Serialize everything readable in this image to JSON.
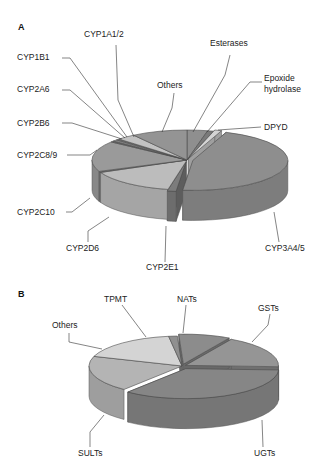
{
  "chart_data": [
    {
      "panel": "A",
      "type": "pie",
      "style": "3d",
      "title": "",
      "slices": [
        {
          "label": "Esterases",
          "value": 3.5,
          "color": "#8f8f8f"
        },
        {
          "label": "Epoxide hydrolase",
          "value": 1.0,
          "color": "#7a7a7a"
        },
        {
          "label": "DPYD",
          "value": 1.2,
          "color": "#d4d4d4"
        },
        {
          "label": "CYP3A4/5",
          "value": 46.0,
          "color": "#8e8e8e"
        },
        {
          "label": "CYP2E1",
          "value": 1.5,
          "color": "#7c7c7c"
        },
        {
          "label": "CYP2D6",
          "value": 15.0,
          "color": "#bcbcbc"
        },
        {
          "label": "CYP2C10",
          "value": 0.6,
          "color": "#6e6e6e"
        },
        {
          "label": "CYP2C8/9",
          "value": 16.5,
          "color": "#9a9a9a"
        },
        {
          "label": "CYP2B6",
          "value": 0.6,
          "color": "#6a6a6a"
        },
        {
          "label": "CYP2A6",
          "value": 0.8,
          "color": "#8a8a8a"
        },
        {
          "label": "CYP1B1",
          "value": 0.6,
          "color": "#777777"
        },
        {
          "label": "CYP1A1/2",
          "value": 3.2,
          "color": "#c2c2c2"
        },
        {
          "label": "Others",
          "value": 9.5,
          "color": "#949494"
        }
      ]
    },
    {
      "panel": "B",
      "type": "pie",
      "style": "3d",
      "title": "",
      "slices": [
        {
          "label": "NATs",
          "value": 9.0,
          "color": "#8c8c8c"
        },
        {
          "label": "GSTs",
          "value": 17.5,
          "color": "#959595"
        },
        {
          "label": "UGTs",
          "value": 35.0,
          "color": "#868686"
        },
        {
          "label": "SULTs",
          "value": 19.5,
          "color": "#b4b4b4"
        },
        {
          "label": "Others",
          "value": 17.5,
          "color": "#d4d4d4"
        },
        {
          "label": "TPMT",
          "value": 1.5,
          "color": "#909090"
        }
      ]
    }
  ],
  "labels": {
    "panelA": "A",
    "panelB": "B",
    "A": {
      "CYP1A1/2": "CYP1A1/2",
      "CYP1B1": "CYP1B1",
      "CYP2A6": "CYP2A6",
      "CYP2B6": "CYP2B6",
      "CYP2C8/9": "CYP2C8/9",
      "CYP2C10": "CYP2C10",
      "CYP2D6": "CYP2D6",
      "CYP2E1": "CYP2E1",
      "CYP3A4/5": "CYP3A4/5",
      "DPYD": "DPYD",
      "Epoxide1": "Epoxide",
      "Epoxide2": "hydrolase",
      "Esterases": "Esterases",
      "Others": "Others"
    },
    "B": {
      "TPMT": "TPMT",
      "NATs": "NATs",
      "GSTs": "GSTs",
      "Others": "Others",
      "SULTs": "SULTs",
      "UGTs": "UGTs"
    }
  }
}
